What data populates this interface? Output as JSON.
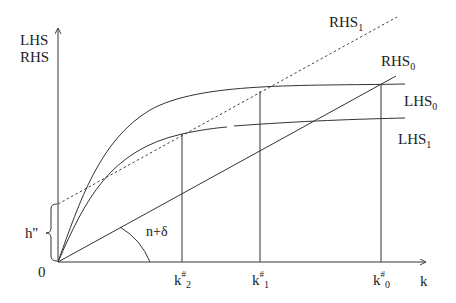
{
  "diagram": {
    "y_axis_label_line1": "LHS",
    "y_axis_label_line2": "RHS",
    "x_axis_label": "k",
    "origin_label": "0",
    "intercept_label": "h''",
    "angle_label": "n+δ",
    "curves": {
      "rhs1": {
        "base": "RHS",
        "sub": "1",
        "style": "dashed"
      },
      "rhs0": {
        "base": "RHS",
        "sub": "0",
        "style": "solid"
      },
      "lhs0": {
        "base": "LHS",
        "sub": "0",
        "style": "solid"
      },
      "lhs1": {
        "base": "LHS",
        "sub": "1",
        "style": "solid"
      }
    },
    "ticks": [
      {
        "base": "k",
        "sup": "#",
        "sub": "2"
      },
      {
        "base": "k",
        "sup": "#",
        "sub": "1"
      },
      {
        "base": "k",
        "sup": "#",
        "sub": "0"
      }
    ]
  }
}
